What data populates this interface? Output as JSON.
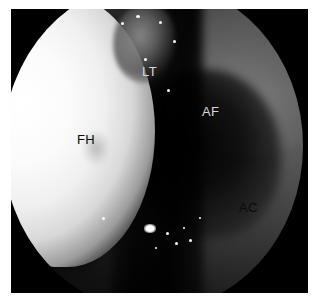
{
  "figure": {
    "kind": "arthroscopic-photograph",
    "modality": "hip arthroscopy",
    "view": "circular endoscope field of view",
    "frame_color": "#000000",
    "page_background": "#ffffff"
  },
  "labels": [
    {
      "id": "fh",
      "text": "FH",
      "meaning": "femoral head",
      "color": "#0a0a0a",
      "on_region": "bright convex femoral head"
    },
    {
      "id": "lt",
      "text": "LT",
      "meaning": "ligamentum teres",
      "color": "#d8d8d8",
      "on_region": "gray bundle at top center"
    },
    {
      "id": "af",
      "text": "AF",
      "meaning": "acetabular fossa",
      "color": "#d8d8d8",
      "on_region": "dark recess right of center"
    },
    {
      "id": "ac",
      "text": "AC",
      "meaning": "acetabular cartilage",
      "color": "#0a0a0a",
      "on_region": "gray tissue lower right"
    }
  ],
  "regions": [
    {
      "name": "femoral-head",
      "tone": "bright white",
      "hex": "#ffffff"
    },
    {
      "name": "ligamentum-teres",
      "tone": "mid gray",
      "hex": "#8a8a8a"
    },
    {
      "name": "acetabular-fossa",
      "tone": "near black",
      "hex": "#050505"
    },
    {
      "name": "acetabular-cartilage",
      "tone": "dark gray",
      "hex": "#6a6a6a"
    },
    {
      "name": "scope-vignette",
      "tone": "black",
      "hex": "#000000"
    }
  ]
}
